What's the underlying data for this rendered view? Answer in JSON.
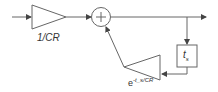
{
  "diagram": {
    "title": "",
    "blocks": {
      "input_gain": {
        "label": "1/CR",
        "shape": "triangle-right"
      },
      "summer": {
        "label": "+",
        "shape": "circle"
      },
      "delay": {
        "label": "t",
        "subscript": "s",
        "shape": "box"
      },
      "feedback_gain": {
        "label_base": "e",
        "label_exponent": "-t_s/CR",
        "shape": "triangle-left"
      }
    },
    "colors": {
      "stroke": "#555555",
      "text": "#333333",
      "background": "#ffffff"
    }
  }
}
